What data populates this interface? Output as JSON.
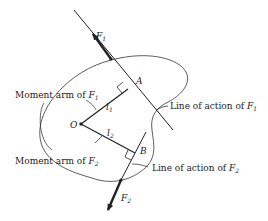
{
  "diagram": {
    "points": {
      "O": {
        "label": "O"
      },
      "A": {
        "label": "A"
      },
      "B": {
        "label": "B"
      }
    },
    "forces": [
      {
        "name": "F",
        "sub": "1",
        "direction": "up-left"
      },
      {
        "name": "F",
        "sub": "2",
        "direction": "down-left"
      }
    ],
    "arms": [
      {
        "name": "l",
        "sub": "1"
      },
      {
        "name": "l",
        "sub": "2"
      }
    ],
    "callouts": {
      "moment_arm_f1": {
        "text": "Moment arm of ",
        "var": "F",
        "sub": "1"
      },
      "moment_arm_f2": {
        "text": "Moment arm of ",
        "var": "F",
        "sub": "2"
      },
      "line_of_action_f1": {
        "text": "Line of action of ",
        "var": "F",
        "sub": "1"
      },
      "line_of_action_f2": {
        "text": "Line of action of ",
        "var": "F",
        "sub": "2"
      }
    },
    "colors": {
      "ink": "#222222",
      "background": "#ffffff"
    }
  }
}
